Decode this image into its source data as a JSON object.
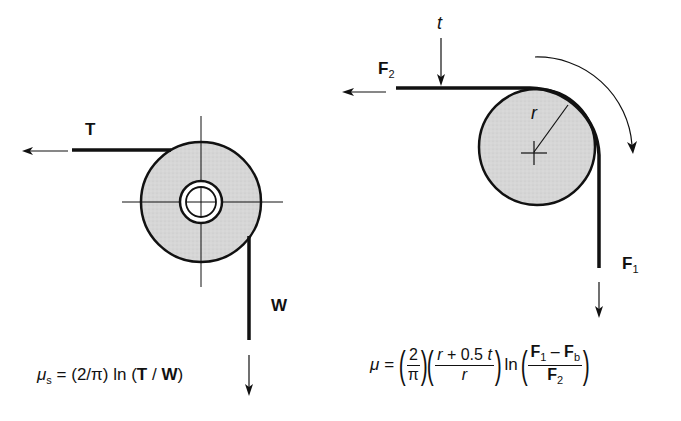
{
  "left_diagram": {
    "labels": {
      "tension": "T",
      "weight": "W"
    },
    "formula": {
      "lhs": "μ",
      "lhs_sub": "s",
      "equals": "=",
      "coef": "(2/π)",
      "ln": "ln",
      "arg_open": "(",
      "arg_T": "T",
      "arg_slash": " / ",
      "arg_W": "W",
      "arg_close": ")"
    }
  },
  "right_diagram": {
    "labels": {
      "thickness": "t",
      "radius": "r",
      "force2": "F",
      "force2_sub": "2",
      "force1": "F",
      "force1_sub": "1"
    },
    "formula": {
      "lhs": "μ",
      "equals": "=",
      "frac1_num": "2",
      "frac1_den": "π",
      "frac2_num_a": "r",
      "frac2_num_b": " + 0.5 ",
      "frac2_num_c": "t",
      "frac2_den": "r",
      "ln": "ln",
      "frac3_num_F1": "F",
      "frac3_num_F1_sub": "1",
      "frac3_num_minus": " – ",
      "frac3_num_Fb": "F",
      "frac3_num_Fb_sub": "b",
      "frac3_den_F2": "F",
      "frac3_den_F2_sub": "2"
    }
  },
  "colors": {
    "ink": "#111111",
    "fill": "#d9d9d9",
    "background": "#ffffff"
  }
}
